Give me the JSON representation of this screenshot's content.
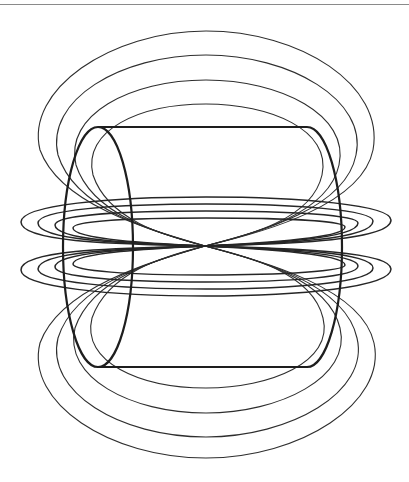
{
  "figure": {
    "description": "Magnetic field lines around a cylindrical solenoid / current-carrying cylinder, drawn as line art",
    "colors": {
      "background": "#ffffff",
      "line": "#2e2e2e",
      "cylinder": "#1e1e1e",
      "top_rule": "#8a8a8a"
    },
    "cylinder": {
      "left_end": {
        "cx": 98,
        "cy": 247,
        "rx": 35,
        "ry": 120
      },
      "right_end": {
        "cx": 307,
        "cy": 247,
        "rx": 35,
        "ry": 120
      },
      "top_y": 127,
      "bottom_y": 367
    },
    "pinch_point": {
      "x": 205,
      "y": 246
    },
    "top_loops": [
      {
        "left_x": 39,
        "top_y": 31,
        "right_x": 374
      },
      {
        "left_x": 57,
        "top_y": 55,
        "right_x": 357
      },
      {
        "left_x": 75,
        "top_y": 80,
        "right_x": 340
      },
      {
        "left_x": 92,
        "top_y": 104,
        "right_x": 323
      }
    ],
    "bottom_loops": [
      {
        "left_x": 39,
        "bottom_y": 458,
        "right_x": 375
      },
      {
        "left_x": 57,
        "bottom_y": 437,
        "right_x": 358
      },
      {
        "left_x": 74,
        "bottom_y": 413,
        "right_x": 340
      },
      {
        "left_x": 91,
        "bottom_y": 388,
        "right_x": 323
      }
    ],
    "upper_horizontal_loops": [
      {
        "left_x": 21,
        "right_x": 391,
        "top_y": 197
      },
      {
        "left_x": 38,
        "right_x": 373,
        "top_y": 204
      },
      {
        "left_x": 55,
        "right_x": 358,
        "top_y": 211
      },
      {
        "left_x": 73,
        "right_x": 345,
        "top_y": 218
      }
    ],
    "lower_horizontal_loops": [
      {
        "left_x": 21,
        "right_x": 391,
        "bottom_y": 296
      },
      {
        "left_x": 38,
        "right_x": 373,
        "bottom_y": 289
      },
      {
        "left_x": 55,
        "right_x": 358,
        "bottom_y": 282
      },
      {
        "left_x": 73,
        "right_x": 345,
        "bottom_y": 275
      }
    ]
  }
}
